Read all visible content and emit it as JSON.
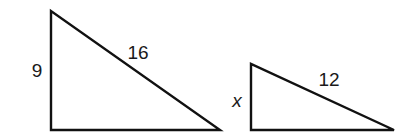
{
  "diagram": {
    "type": "similar-right-triangles",
    "stroke_color": "#111111",
    "background": "#ffffff",
    "triangles": [
      {
        "id": "large",
        "vertices": {
          "top": [
            51,
            11
          ],
          "right_angle": [
            51,
            130
          ],
          "far": [
            220,
            130
          ]
        },
        "labels": {
          "leg": "9",
          "hypotenuse": "16"
        }
      },
      {
        "id": "small",
        "vertices": {
          "top": [
            251,
            64
          ],
          "right_angle": [
            251,
            130
          ],
          "far": [
            394,
            130
          ]
        },
        "labels": {
          "leg": "x",
          "hypotenuse": "12"
        }
      }
    ]
  }
}
